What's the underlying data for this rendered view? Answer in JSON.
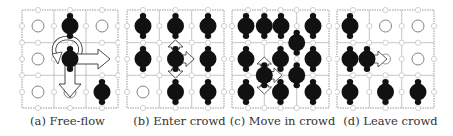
{
  "figure": {
    "panels": [
      {
        "caption": "(a) Free-flow",
        "x": 22,
        "y": 10,
        "size": 96,
        "grid": "3x3",
        "agents": [
          [
            1,
            0
          ],
          [
            1,
            1
          ],
          [
            2,
            2
          ]
        ],
        "empty": [
          [
            0,
            0
          ],
          [
            2,
            0
          ],
          [
            0,
            1
          ],
          [
            0,
            2
          ],
          [
            1,
            2
          ]
        ],
        "arrows": [
          "right",
          "down",
          "rotate"
        ]
      },
      {
        "caption": "(b) Enter crowd",
        "x": 127,
        "y": 10,
        "size": 97,
        "grid": "3x3",
        "agents": [
          [
            0,
            0
          ],
          [
            1,
            0
          ],
          [
            2,
            0
          ],
          [
            0,
            1
          ],
          [
            1,
            1
          ],
          [
            2,
            1
          ],
          [
            1,
            2
          ],
          [
            2,
            2
          ]
        ],
        "empty": [
          [
            0,
            2
          ]
        ],
        "arrows": [
          "up",
          "right",
          "down"
        ]
      },
      {
        "caption": "(c) Move in crowd",
        "x": 232,
        "y": 10,
        "size": 97,
        "grid": "3x3",
        "agents": "dense crowd, 13 agents",
        "arrows": [
          "up",
          "right",
          "down"
        ]
      },
      {
        "caption": "(d) Leave crowd",
        "x": 337,
        "y": 10,
        "size": 97,
        "grid": "3x3",
        "agents": [
          [
            0,
            0
          ],
          [
            0,
            1
          ],
          [
            0.55,
            1
          ],
          [
            0,
            2
          ],
          [
            1,
            2
          ],
          [
            2,
            2
          ]
        ],
        "empty": [
          [
            1,
            0
          ],
          [
            2,
            0
          ],
          [
            2,
            1
          ]
        ],
        "arrows": [
          "right"
        ]
      }
    ]
  },
  "colors": {
    "agent": "#111111",
    "grid": "#aaaaaa",
    "node": "#bbbbbb",
    "empty_cell": "#777777",
    "arrow_fill": "#ffffff",
    "arrow_stroke": "#333333",
    "caption": "#333333"
  }
}
